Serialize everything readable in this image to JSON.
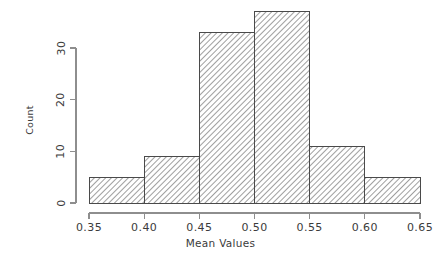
{
  "chart_data": {
    "type": "bar",
    "title": "",
    "subtitle": "",
    "xlabel": "Mean Values",
    "ylabel": "Count",
    "categories": [
      "0.35-0.40",
      "0.40-0.45",
      "0.45-0.50",
      "0.50-0.55",
      "0.55-0.60",
      "0.60-0.65"
    ],
    "bin_edges": [
      0.35,
      0.4,
      0.45,
      0.5,
      0.55,
      0.6,
      0.65
    ],
    "values": [
      5,
      9,
      33,
      37,
      11,
      5
    ],
    "xlim": [
      0.35,
      0.65
    ],
    "ylim": [
      0,
      37
    ],
    "x_ticks": [
      0.35,
      0.4,
      0.45,
      0.5,
      0.55,
      0.6,
      0.65
    ],
    "x_tick_labels": [
      "0.35",
      "0.40",
      "0.45",
      "0.50",
      "0.55",
      "0.60",
      "0.65"
    ],
    "y_ticks": [
      0,
      10,
      20,
      30
    ],
    "y_tick_labels": [
      "0",
      "10",
      "20",
      "30"
    ],
    "grid": false,
    "legend": null,
    "legend_position": "none",
    "bar_fill": "hatch-diagonal",
    "bar_edge_color": "#4a4a4a",
    "axis_color": "#8e8e8e",
    "text_color": "#3b3b3b",
    "background_color": "#ffffff",
    "y_tick_label_rotation": 90,
    "y_axis_label_rotation": 90
  },
  "axes": {
    "x_title": "Mean Values",
    "y_title": "Count",
    "x_ticks": [
      {
        "label": "0.35",
        "value": 0.35
      },
      {
        "label": "0.40",
        "value": 0.4
      },
      {
        "label": "0.45",
        "value": 0.45
      },
      {
        "label": "0.50",
        "value": 0.5
      },
      {
        "label": "0.55",
        "value": 0.55
      },
      {
        "label": "0.60",
        "value": 0.6
      },
      {
        "label": "0.65",
        "value": 0.65
      }
    ],
    "y_ticks": [
      {
        "label": "0",
        "value": 0
      },
      {
        "label": "10",
        "value": 10
      },
      {
        "label": "20",
        "value": 20
      },
      {
        "label": "30",
        "value": 30
      }
    ]
  },
  "bars": [
    {
      "label": "0.35-0.40",
      "value": 5
    },
    {
      "label": "0.40-0.45",
      "value": 9
    },
    {
      "label": "0.45-0.50",
      "value": 33
    },
    {
      "label": "0.50-0.55",
      "value": 37
    },
    {
      "label": "0.55-0.60",
      "value": 11
    },
    {
      "label": "0.60-0.65",
      "value": 5
    }
  ]
}
